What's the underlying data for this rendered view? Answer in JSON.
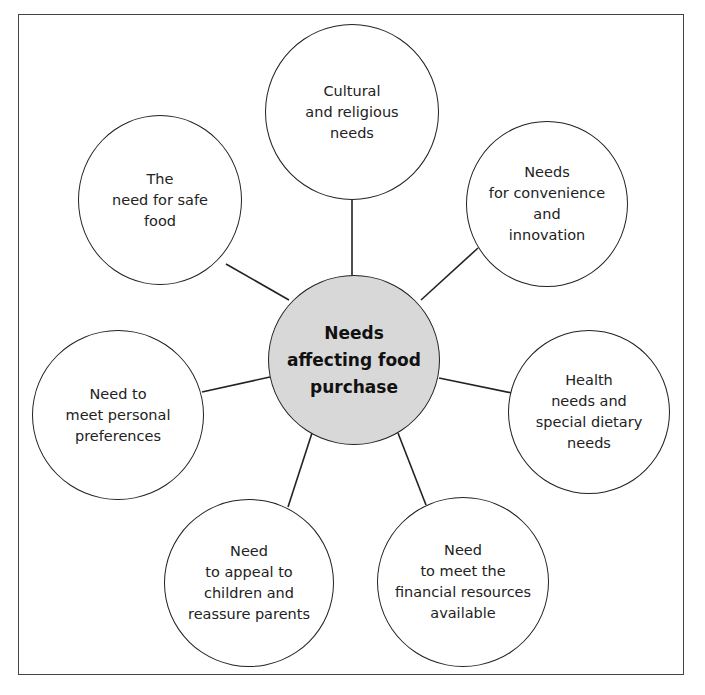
{
  "diagram": {
    "center": {
      "label": "Needs\naffecting food\npurchase",
      "fill": "#d8d8d8"
    },
    "nodes": [
      {
        "id": "cultural",
        "label": "Cultural\nand religious\nneeds"
      },
      {
        "id": "convenience",
        "label": "Needs\nfor convenience\nand\ninnovation"
      },
      {
        "id": "health",
        "label": "Health\nneeds and\nspecial dietary\nneeds"
      },
      {
        "id": "financial",
        "label": "Need\nto meet the\nfinancial resources\navailable"
      },
      {
        "id": "children",
        "label": "Need\nto appeal to\nchildren and\nreassure parents"
      },
      {
        "id": "preferences",
        "label": "Need to\nmeet personal\npreferences"
      },
      {
        "id": "safe-food",
        "label": "The\nneed for safe\nfood"
      }
    ]
  }
}
